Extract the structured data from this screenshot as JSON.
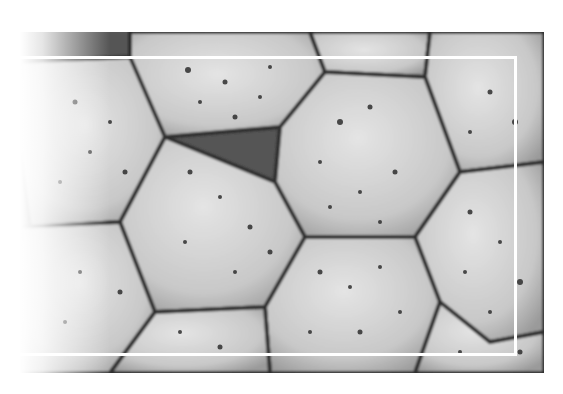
{
  "image": {
    "subject": "close-up of hexagonal porous stone tiles",
    "palette": {
      "tile_light": "#d9d9d9",
      "tile_mid": "#bdbdbd",
      "groove": "#3a3a3a",
      "pore": "#2e2e2e",
      "frame": "#ffffff",
      "background": "#ffffff"
    },
    "frame": {
      "x": 16,
      "y": 56,
      "width": 498,
      "height": 294
    }
  }
}
